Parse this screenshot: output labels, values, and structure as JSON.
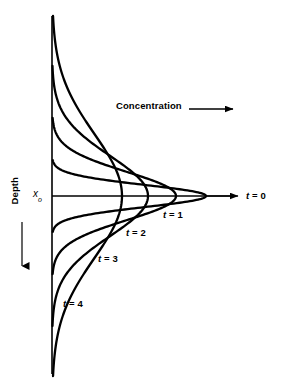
{
  "figure": {
    "background_color": "#ffffff",
    "line_color": "#000000",
    "axis_color": "#000000"
  },
  "axes": {
    "vertical_axis": {
      "name": "depth-axis",
      "x": 52,
      "y_top": 16,
      "y_bottom": 374,
      "stroke_width": 1.6
    },
    "baseline": {
      "name": "x0-baseline",
      "y": 196,
      "x_start": 52,
      "x_end": 238,
      "stroke_width": 1.4
    },
    "origin_label": "x",
    "origin_subscript": "o"
  },
  "labels": {
    "concentration": "Concentration",
    "depth": "Depth",
    "t0": "t = 0",
    "t1": "t = 1",
    "t2": "t = 2",
    "t3": "t = 3",
    "t4": "t = 4"
  },
  "arrows": {
    "concentration_arrow": {
      "name": "concentration-arrow",
      "x1": 189,
      "y1": 109,
      "x2": 232,
      "y2": 109,
      "direction": "right"
    },
    "depth_arrow": {
      "name": "depth-arrow",
      "x1": 22,
      "y1": 222,
      "x2": 22,
      "y2": 265,
      "direction": "down"
    },
    "t0_arrow": {
      "name": "t0-spike-arrow",
      "x1": 52,
      "y1": 196,
      "x2": 238,
      "y2": 196,
      "direction": "right"
    }
  },
  "chart_data": {
    "type": "line",
    "xlabel": "Concentration",
    "ylabel": "Depth",
    "orientation": "horizontal-profiles",
    "note": "Each curve is a Gaussian concentration profile symmetric about the depth x_o; with increasing time the peak concentration falls and the profile broadens in depth.",
    "baseline_depth": "x_o",
    "series": [
      {
        "name": "t = 0",
        "time": 0,
        "peak_concentration": 1.0,
        "half_width_depth": 0.0,
        "description": "initial spike at x_o, drawn as the horizontal arrow",
        "peak_x_px": 238,
        "sigma_px": 0,
        "render": "arrow"
      },
      {
        "name": "t = 1",
        "time": 1,
        "peak_concentration": 0.87,
        "half_width_depth": 0.22,
        "peak_x_px": 206,
        "sigma_px": 11,
        "render": "gaussian"
      },
      {
        "name": "t = 2",
        "time": 2,
        "peak_concentration": 0.67,
        "half_width_depth": 0.42,
        "peak_x_px": 176,
        "sigma_px": 24,
        "render": "gaussian"
      },
      {
        "name": "t = 3",
        "time": 3,
        "peak_concentration": 0.5,
        "half_width_depth": 0.62,
        "peak_x_px": 148,
        "sigma_px": 40,
        "render": "gaussian"
      },
      {
        "name": "t = 4",
        "time": 4,
        "peak_concentration": 0.38,
        "half_width_depth": 0.85,
        "peak_x_px": 122,
        "sigma_px": 62,
        "render": "gaussian"
      }
    ],
    "legend": "inline annotations",
    "grid": false
  }
}
